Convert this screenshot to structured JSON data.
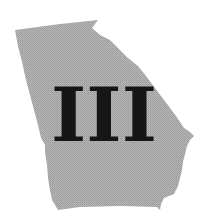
{
  "map": {
    "region": "Georgia",
    "fill_color": "#acacac",
    "background_color": "#ffffff"
  },
  "label": {
    "text": "III",
    "color": "#161616"
  }
}
